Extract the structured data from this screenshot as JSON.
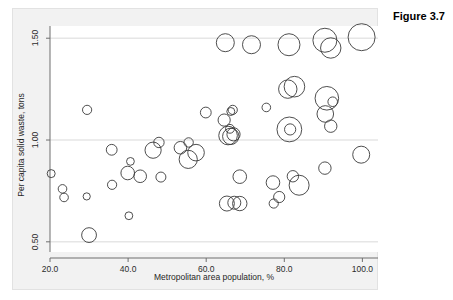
{
  "caption": "Figure 3.7",
  "chart_data": {
    "type": "scatter",
    "title": "",
    "subtitle": "",
    "xlabel": "Metropolitan area population, %",
    "ylabel": "Per capita solid waste, tons",
    "xlim": [
      20.0,
      104.0
    ],
    "ylim": [
      0.45,
      1.56
    ],
    "xticks": [
      20.0,
      40.0,
      60.0,
      80.0,
      100.0
    ],
    "xtick_labels": [
      "20.0",
      "40.0",
      "60.0",
      "80.0",
      "100.0"
    ],
    "yticks": [
      0.5,
      1.0,
      1.5
    ],
    "ytick_labels": [
      "0.50",
      "1.00",
      "1.50"
    ],
    "grid": "horizontal",
    "legend": "none",
    "marker": "open-circle",
    "marker_fill": "none",
    "marker_stroke": "#3a3a3a",
    "bubble_size_encoding": "third variable (area proportional)",
    "points": [
      {
        "x": 20.3,
        "y": 0.835,
        "r": 4.0
      },
      {
        "x": 23.2,
        "y": 0.76,
        "r": 4.3
      },
      {
        "x": 23.6,
        "y": 0.718,
        "r": 4.3
      },
      {
        "x": 29.5,
        "y": 1.148,
        "r": 4.6
      },
      {
        "x": 29.4,
        "y": 0.723,
        "r": 3.6
      },
      {
        "x": 30.0,
        "y": 0.533,
        "r": 7.4
      },
      {
        "x": 35.8,
        "y": 0.952,
        "r": 5.4
      },
      {
        "x": 35.9,
        "y": 0.78,
        "r": 4.6
      },
      {
        "x": 39.9,
        "y": 0.838,
        "r": 6.8
      },
      {
        "x": 40.6,
        "y": 0.895,
        "r": 3.9
      },
      {
        "x": 40.2,
        "y": 0.628,
        "r": 3.9
      },
      {
        "x": 43.1,
        "y": 0.822,
        "r": 6.3
      },
      {
        "x": 46.4,
        "y": 0.95,
        "r": 8.1
      },
      {
        "x": 47.9,
        "y": 0.988,
        "r": 5.2
      },
      {
        "x": 48.4,
        "y": 0.818,
        "r": 5.0
      },
      {
        "x": 53.4,
        "y": 0.962,
        "r": 6.3
      },
      {
        "x": 55.5,
        "y": 0.988,
        "r": 4.7
      },
      {
        "x": 55.4,
        "y": 0.905,
        "r": 9.1
      },
      {
        "x": 57.4,
        "y": 0.938,
        "r": 8.3
      },
      {
        "x": 59.9,
        "y": 1.135,
        "r": 5.4
      },
      {
        "x": 64.9,
        "y": 1.478,
        "r": 9.0
      },
      {
        "x": 64.6,
        "y": 1.098,
        "r": 6.1
      },
      {
        "x": 66.3,
        "y": 1.14,
        "r": 4.0
      },
      {
        "x": 65.6,
        "y": 1.022,
        "r": 9.3
      },
      {
        "x": 66.3,
        "y": 1.018,
        "r": 8.2
      },
      {
        "x": 67.0,
        "y": 1.028,
        "r": 6.6
      },
      {
        "x": 66.1,
        "y": 1.055,
        "r": 4.4
      },
      {
        "x": 66.8,
        "y": 1.148,
        "r": 4.6
      },
      {
        "x": 65.3,
        "y": 0.688,
        "r": 7.5
      },
      {
        "x": 67.2,
        "y": 0.692,
        "r": 6.5
      },
      {
        "x": 68.6,
        "y": 0.688,
        "r": 7.2
      },
      {
        "x": 68.6,
        "y": 0.82,
        "r": 6.8
      },
      {
        "x": 71.6,
        "y": 1.468,
        "r": 9.0
      },
      {
        "x": 75.4,
        "y": 1.16,
        "r": 4.3
      },
      {
        "x": 77.1,
        "y": 0.791,
        "r": 6.8
      },
      {
        "x": 77.3,
        "y": 0.688,
        "r": 4.6
      },
      {
        "x": 78.7,
        "y": 0.72,
        "r": 5.6
      },
      {
        "x": 81.2,
        "y": 1.468,
        "r": 11.0
      },
      {
        "x": 80.9,
        "y": 1.25,
        "r": 9.2
      },
      {
        "x": 82.6,
        "y": 1.262,
        "r": 10.3
      },
      {
        "x": 81.3,
        "y": 1.052,
        "r": 12.4
      },
      {
        "x": 81.5,
        "y": 1.052,
        "r": 5.6
      },
      {
        "x": 82.2,
        "y": 0.822,
        "r": 5.7
      },
      {
        "x": 83.8,
        "y": 0.778,
        "r": 10.0
      },
      {
        "x": 90.4,
        "y": 1.49,
        "r": 12.0
      },
      {
        "x": 91.9,
        "y": 1.452,
        "r": 10.2
      },
      {
        "x": 90.9,
        "y": 1.205,
        "r": 11.8
      },
      {
        "x": 92.4,
        "y": 1.188,
        "r": 4.8
      },
      {
        "x": 90.5,
        "y": 1.128,
        "r": 8.3
      },
      {
        "x": 91.9,
        "y": 1.068,
        "r": 6.2
      },
      {
        "x": 90.4,
        "y": 0.862,
        "r": 6.2
      },
      {
        "x": 99.8,
        "y": 1.505,
        "r": 13.5
      },
      {
        "x": 99.7,
        "y": 0.928,
        "r": 8.5
      }
    ]
  }
}
